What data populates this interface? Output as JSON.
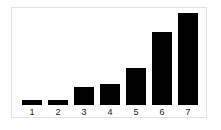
{
  "chart_data": {
    "type": "bar",
    "title": "",
    "subtitle": "",
    "xlabel": "",
    "ylabel": "",
    "categories": [
      "1",
      "2",
      "3",
      "4",
      "5",
      "6",
      "7"
    ],
    "values": [
      0.4,
      0.4,
      1.4,
      1.6,
      2.8,
      5.6,
      7.0
    ],
    "series": [
      {
        "name": "",
        "values": [
          0.4,
          0.4,
          1.4,
          1.6,
          2.8,
          5.6,
          7.0
        ]
      }
    ],
    "bar_pixel_heights": [
      5,
      5,
      18,
      20,
      36,
      72,
      91
    ],
    "ylim": [
      0,
      7.4
    ],
    "xlim_categories": 7,
    "grid": false,
    "legend": false,
    "legend_position": "none",
    "annotations": [],
    "tick_labels": {
      "x": [
        "1",
        "2",
        "3",
        "4",
        "5",
        "6",
        "7"
      ],
      "y": []
    }
  },
  "style": {
    "bar_color": "#000000",
    "background_color": "#ffffff",
    "frame_color": "#e2e2e2",
    "label_color": "#1a1a1a"
  }
}
